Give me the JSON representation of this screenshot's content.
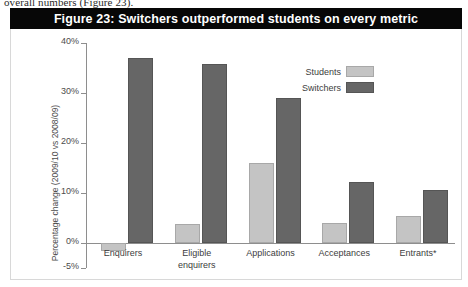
{
  "page": {
    "body_text_cut_off": "overall numbers (Figure 23)."
  },
  "figure": {
    "title": "Figure 23: Switchers outperformed students on every metric",
    "title_background": "#070707",
    "title_color": "#ffffff"
  },
  "legend": {
    "position": "top-right",
    "entries": [
      {
        "label": "Students",
        "color": "#c4c4c4"
      },
      {
        "label": "Switchers",
        "color": "#666666"
      }
    ]
  },
  "axes": {
    "y_title": "Percentage change (2009/10 vs 2008/09)",
    "y_ticks": [
      "40%",
      "30%",
      "20%",
      "10%",
      "0%",
      "-5%"
    ]
  },
  "chart_data": {
    "type": "bar",
    "title": "Figure 23: Switchers outperformed students on every metric",
    "xlabel": "",
    "ylabel": "Percentage change (2009/10 vs 2008/09)",
    "ylim": [
      -5,
      40
    ],
    "yticks": [
      -5,
      0,
      10,
      20,
      30,
      40
    ],
    "ytick_labels": [
      "-5%",
      "0%",
      "10%",
      "20%",
      "30%",
      "40%"
    ],
    "grid": false,
    "legend_position": "upper right",
    "categories": [
      "Enquirers",
      "Eligible enquirers",
      "Applications",
      "Acceptances",
      "Entrants*"
    ],
    "series": [
      {
        "name": "Students",
        "color": "#c4c4c4",
        "values": [
          -1.5,
          3.8,
          16.0,
          4.0,
          5.5
        ]
      },
      {
        "name": "Switchers",
        "color": "#666666",
        "values": [
          37.0,
          35.8,
          29.0,
          12.2,
          10.6
        ]
      }
    ]
  }
}
